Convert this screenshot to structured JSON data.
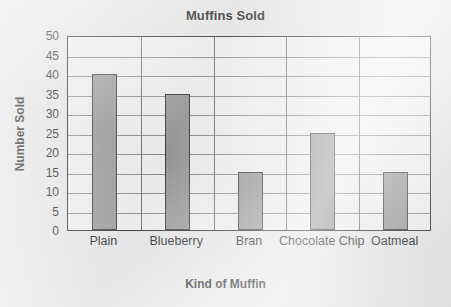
{
  "chart_data": {
    "type": "bar",
    "title": "Muffins Sold",
    "xlabel": "Kind of Muffin",
    "ylabel": "Number Sold",
    "categories": [
      "Plain",
      "Blueberry",
      "Bran",
      "Chocolate Chip",
      "Oatmeal"
    ],
    "values": [
      40,
      35,
      15,
      25,
      15
    ],
    "ylim": [
      0,
      50
    ],
    "ytick_step": 5,
    "yticks": [
      50,
      45,
      40,
      35,
      30,
      25,
      20,
      15,
      10,
      5,
      0
    ],
    "grid": true,
    "legend": null,
    "bar_color": "#9b9b9b",
    "bar_border_color": "#3a3a3a",
    "plot_background": "#f2f2f2",
    "page_background": "#e9e9e9",
    "axis_color": "#2b2b2b",
    "gridline_color": "#8c8c8c"
  }
}
